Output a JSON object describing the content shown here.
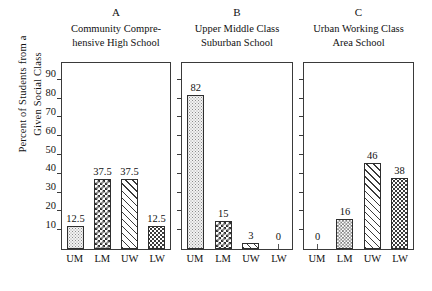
{
  "figure": {
    "ylabel_line1": "Percent of Students from a",
    "ylabel_line2": "Given Social Class",
    "y_ticks": [
      10,
      20,
      30,
      40,
      50,
      60,
      70,
      80,
      90
    ]
  },
  "panels": [
    {
      "letter": "A",
      "title_line1": "Community Compre-",
      "title_line2": "hensive High School",
      "categories": [
        "UM",
        "LM",
        "UW",
        "LW"
      ],
      "values": [
        12.5,
        37.5,
        37.5,
        12.5
      ],
      "labels": [
        "12.5",
        "37.5",
        "37.5",
        "12.5"
      ],
      "patterns": [
        "p-stipple-light",
        "p-checker",
        "p-diag",
        "p-dots"
      ]
    },
    {
      "letter": "B",
      "title_line1": "Upper Middle Class",
      "title_line2": "Suburban School",
      "categories": [
        "UM",
        "LM",
        "UW",
        "LW"
      ],
      "values": [
        82,
        15,
        3,
        0
      ],
      "labels": [
        "82",
        "15",
        "3",
        "0"
      ],
      "patterns": [
        "p-stipple-light",
        "p-checker",
        "p-diag",
        "p-dots"
      ]
    },
    {
      "letter": "C",
      "title_line1": "Urban Working Class",
      "title_line2": "Area School",
      "categories": [
        "UM",
        "LM",
        "UW",
        "LW"
      ],
      "values": [
        0,
        16,
        46,
        38
      ],
      "labels": [
        "0",
        "16",
        "46",
        "38"
      ],
      "patterns": [
        "p-stipple-light",
        "p-checker-fine",
        "p-diag",
        "p-dots"
      ]
    }
  ],
  "chart_data": {
    "type": "bar",
    "title": "",
    "xlabel": "",
    "ylabel": "Percent of Students from a Given Social Class",
    "ylim": [
      0,
      100
    ],
    "yticks": [
      10,
      20,
      30,
      40,
      50,
      60,
      70,
      80,
      90
    ],
    "grid": false,
    "legend": "none",
    "categories": [
      "UM",
      "LM",
      "UW",
      "LW"
    ],
    "panels": [
      {
        "panel": "A",
        "panel_title": "Community Comprehensive High School",
        "values": [
          12.5,
          37.5,
          37.5,
          12.5
        ]
      },
      {
        "panel": "B",
        "panel_title": "Upper Middle Class Suburban School",
        "values": [
          82,
          15,
          3,
          0
        ]
      },
      {
        "panel": "C",
        "panel_title": "Urban Working Class Area School",
        "values": [
          0,
          16,
          46,
          38
        ]
      }
    ]
  }
}
